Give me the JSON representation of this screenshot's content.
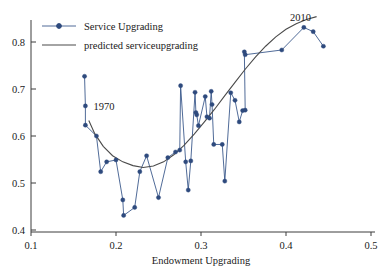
{
  "chart_data": {
    "type": "scatter",
    "title": "",
    "xlabel": "Endowment Upgrading",
    "ylabel": "",
    "xlim": [
      0.1,
      0.5
    ],
    "ylim": [
      0.4,
      0.85
    ],
    "xticks": [
      0.1,
      0.2,
      0.3,
      0.4,
      0.5
    ],
    "xticklabels": [
      "0.1",
      "0.2",
      "0.3",
      "0.4",
      "0.5"
    ],
    "yticks": [
      0.4,
      0.5,
      0.6,
      0.7,
      0.8
    ],
    "yticklabels": [
      "0.4",
      "0.5",
      "0.6",
      "0.7",
      "0.8"
    ],
    "grid": false,
    "legend_position": "upper left",
    "legend": [
      {
        "label": "Service Upgrading",
        "marker": "circle",
        "line": true,
        "color": "#2e4a7d"
      },
      {
        "label": "predicted serviceupgrading",
        "marker": "none",
        "line": true,
        "color": "#4a4a4a"
      }
    ],
    "annotations": [
      {
        "text": "1970",
        "x": 0.186,
        "y": 0.655
      },
      {
        "text": "2010",
        "x": 0.417,
        "y": 0.845
      }
    ],
    "series": [
      {
        "name": "Service Upgrading",
        "marker": "circle",
        "color": "#2e4a7d",
        "points": [
          [
            0.163,
            0.727
          ],
          [
            0.164,
            0.664
          ],
          [
            0.164,
            0.623
          ],
          [
            0.177,
            0.6
          ],
          [
            0.182,
            0.524
          ],
          [
            0.189,
            0.545
          ],
          [
            0.2,
            0.549
          ],
          [
            0.208,
            0.464
          ],
          [
            0.209,
            0.431
          ],
          [
            0.222,
            0.448
          ],
          [
            0.228,
            0.524
          ],
          [
            0.236,
            0.558
          ],
          [
            0.25,
            0.469
          ],
          [
            0.261,
            0.554
          ],
          [
            0.27,
            0.566
          ],
          [
            0.275,
            0.57
          ],
          [
            0.276,
            0.707
          ],
          [
            0.282,
            0.545
          ],
          [
            0.285,
            0.485
          ],
          [
            0.288,
            0.547
          ],
          [
            0.293,
            0.693
          ],
          [
            0.294,
            0.65
          ],
          [
            0.295,
            0.645
          ],
          [
            0.297,
            0.622
          ],
          [
            0.305,
            0.684
          ],
          [
            0.307,
            0.641
          ],
          [
            0.31,
            0.638
          ],
          [
            0.312,
            0.695
          ],
          [
            0.313,
            0.667
          ],
          [
            0.315,
            0.582
          ],
          [
            0.325,
            0.582
          ],
          [
            0.328,
            0.504
          ],
          [
            0.335,
            0.692
          ],
          [
            0.34,
            0.676
          ],
          [
            0.345,
            0.63
          ],
          [
            0.349,
            0.654
          ],
          [
            0.352,
            0.655
          ],
          [
            0.351,
            0.779
          ],
          [
            0.352,
            0.773
          ],
          [
            0.395,
            0.783
          ],
          [
            0.421,
            0.831
          ],
          [
            0.432,
            0.822
          ],
          [
            0.444,
            0.791
          ]
        ]
      },
      {
        "name": "predicted serviceupgrading",
        "marker": "none",
        "color": "#4a4a4a",
        "points": [
          [
            0.168,
            0.633
          ],
          [
            0.175,
            0.605
          ],
          [
            0.185,
            0.578
          ],
          [
            0.196,
            0.558
          ],
          [
            0.208,
            0.545
          ],
          [
            0.22,
            0.537
          ],
          [
            0.232,
            0.533
          ],
          [
            0.244,
            0.536
          ],
          [
            0.256,
            0.545
          ],
          [
            0.268,
            0.56
          ],
          [
            0.28,
            0.58
          ],
          [
            0.292,
            0.604
          ],
          [
            0.304,
            0.63
          ],
          [
            0.316,
            0.657
          ],
          [
            0.328,
            0.686
          ],
          [
            0.34,
            0.714
          ],
          [
            0.352,
            0.742
          ],
          [
            0.364,
            0.768
          ],
          [
            0.376,
            0.791
          ],
          [
            0.388,
            0.811
          ],
          [
            0.4,
            0.827
          ],
          [
            0.412,
            0.839
          ],
          [
            0.424,
            0.848
          ],
          [
            0.436,
            0.854
          ]
        ]
      }
    ]
  }
}
